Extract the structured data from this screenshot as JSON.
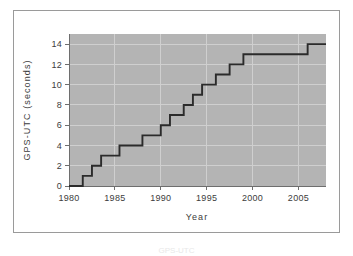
{
  "figure": {
    "background_color": "#ffffff",
    "frame_border_color": "#9a9a9a",
    "caption_partial": "GPS-UTC"
  },
  "chart_data": {
    "type": "line",
    "step": "post",
    "title": "",
    "subtitle": "",
    "xlabel": "Year",
    "ylabel": "GPS-UTC (seconds)",
    "xlim": [
      1980,
      2008
    ],
    "ylim": [
      0,
      15
    ],
    "xticks": [
      1980,
      1985,
      1990,
      1995,
      2000,
      2005
    ],
    "xtick_labels": [
      "1980",
      "1985",
      "1990",
      "1995",
      "2000",
      "2005"
    ],
    "yticks": [
      0,
      2,
      4,
      6,
      8,
      10,
      12,
      14
    ],
    "ytick_labels": [
      "0",
      "2",
      "4",
      "6",
      "8",
      "10",
      "12",
      "14"
    ],
    "grid": true,
    "grid_color": "#cfcfcf",
    "legend": null,
    "plot_background_color": "#b4b4b4",
    "line_color": "#2b2b2b",
    "series": [
      {
        "name": "GPS-UTC offset",
        "x": [
          1980.0,
          1981.5,
          1982.5,
          1983.5,
          1985.5,
          1988.0,
          1990.0,
          1991.0,
          1992.5,
          1993.5,
          1994.5,
          1996.0,
          1997.5,
          1999.0,
          2006.0,
          2008.0
        ],
        "values": [
          0,
          1,
          2,
          3,
          4,
          5,
          6,
          7,
          8,
          9,
          10,
          11,
          12,
          13,
          14,
          14
        ]
      }
    ]
  }
}
